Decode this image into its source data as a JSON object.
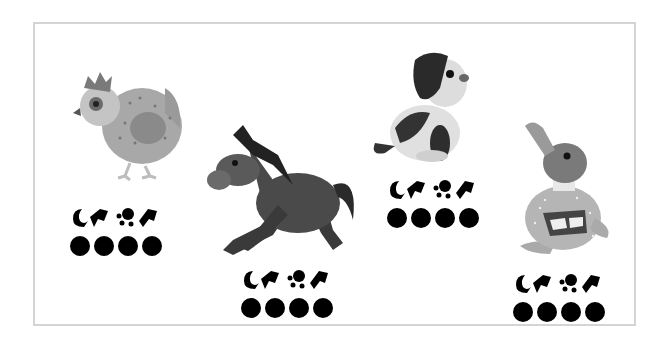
{
  "page": {
    "background": "#ffffff",
    "frame_border_color": "#d4d4d4"
  },
  "cards": [
    {
      "animal": "hen",
      "icon": "hen-icon",
      "symbols": [
        "moon-hand-glyph",
        "paw-arrow-glyph"
      ],
      "dot_count": 4
    },
    {
      "animal": "horse",
      "icon": "horse-icon",
      "symbols": [
        "moon-hand-glyph",
        "paw-arrow-glyph"
      ],
      "dot_count": 4
    },
    {
      "animal": "dog",
      "icon": "dog-icon",
      "symbols": [
        "moon-hand-glyph",
        "paw-arrow-glyph"
      ],
      "dot_count": 4
    },
    {
      "animal": "duck",
      "icon": "duck-icon",
      "symbols": [
        "moon-hand-glyph",
        "paw-arrow-glyph"
      ],
      "dot_count": 4
    }
  ]
}
